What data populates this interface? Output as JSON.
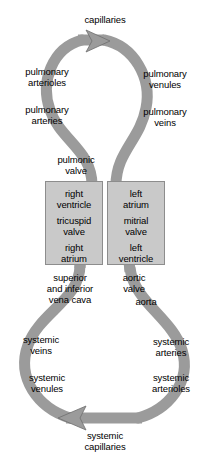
{
  "diagram": {
    "colors": {
      "vessel": "#9b9b9b",
      "vessel_shade": "#8a8a8a",
      "chamber_fill": "#c9c9c9",
      "chamber_border": "#8d8d8d",
      "text": "#000000",
      "background": "#ffffff"
    },
    "pulmonary_loop": {
      "top_label": "capillaries",
      "arrow_direction": "right",
      "left_labels": [
        "pulmonary\narterioles",
        "pulmonary\narteries"
      ],
      "right_labels": [
        "pulmonary\nvenules",
        "pulmonary\nveins"
      ]
    },
    "heart": {
      "top_valve": "pulmonic\nvalve",
      "left_chambers": [
        "right\nventricle",
        "tricuspid\nvalve",
        "right\natrium"
      ],
      "right_chambers": [
        "left\natrium",
        "mitrial\nvalve",
        "left\nventricle"
      ],
      "below_left": "superior\nand inferior\nvena cava",
      "below_right_valve": "aortic\nvalve",
      "below_right_vessel": "aorta"
    },
    "systemic_loop": {
      "bottom_label": "systemic\ncapillaries",
      "arrow_direction": "left",
      "left_labels": [
        "systemic\nveins",
        "systemic\nvenules"
      ],
      "right_labels": [
        "systemic\narteries",
        "systemic\narterioles"
      ]
    }
  }
}
